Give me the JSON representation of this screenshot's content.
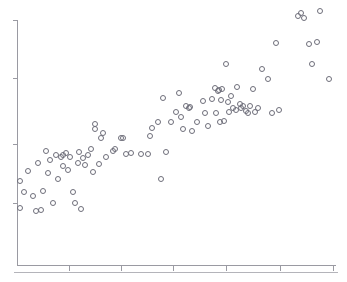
{
  "chart_data": {
    "type": "scatter",
    "title": "",
    "subtitle": "",
    "xlabel": "",
    "ylabel": "",
    "grid": false,
    "legend": null,
    "legend_position": "none",
    "annotations": [],
    "marker": {
      "shape": "circle-open",
      "diameter_px": 5,
      "stroke_color": "#6e6e7a",
      "fill_color": "none",
      "stroke_width": 1
    },
    "axes": {
      "axis_color": "#9a9aa2",
      "spines": [
        "left",
        "bottom"
      ],
      "x_axis_pixel_range": [
        17,
        336
      ],
      "y_axis_pixel_range": [
        20,
        265
      ],
      "x_tick_pixels": [
        69,
        121,
        173,
        226,
        280,
        333
      ],
      "y_tick_pixels": [
        20,
        78,
        144,
        203
      ],
      "x_tick_labels": [
        "",
        "",
        "",
        "",
        "",
        ""
      ],
      "y_tick_labels": [
        "",
        "",
        "",
        ""
      ],
      "xlim": [
        0,
        1
      ],
      "ylim": [
        0,
        1
      ],
      "tick_direction": "out"
    },
    "footer_rule": {
      "visible": true,
      "y_pixel": 272,
      "x_start": 14,
      "x_end": 338,
      "color": "#b4b4ba"
    },
    "n_points": 101,
    "points_pixels": [
      [
        20,
        208
      ],
      [
        20,
        181
      ],
      [
        24,
        192
      ],
      [
        28,
        171
      ],
      [
        33,
        196
      ],
      [
        36,
        211
      ],
      [
        38,
        163
      ],
      [
        41,
        210
      ],
      [
        43,
        191
      ],
      [
        46,
        151
      ],
      [
        48,
        173
      ],
      [
        50,
        160
      ],
      [
        53,
        203
      ],
      [
        56,
        155
      ],
      [
        58,
        179
      ],
      [
        61,
        157
      ],
      [
        63,
        166
      ],
      [
        63,
        155
      ],
      [
        66,
        153
      ],
      [
        68,
        170
      ],
      [
        70,
        157
      ],
      [
        73,
        192
      ],
      [
        75,
        203
      ],
      [
        78,
        163
      ],
      [
        79,
        152
      ],
      [
        81,
        209
      ],
      [
        83,
        158
      ],
      [
        85,
        165
      ],
      [
        88,
        155
      ],
      [
        91,
        149
      ],
      [
        93,
        172
      ],
      [
        95,
        129
      ],
      [
        95,
        124
      ],
      [
        99,
        164
      ],
      [
        101,
        138
      ],
      [
        103,
        133
      ],
      [
        106,
        157
      ],
      [
        113,
        151
      ],
      [
        115,
        149
      ],
      [
        121,
        138
      ],
      [
        123,
        138
      ],
      [
        126,
        154
      ],
      [
        131,
        153
      ],
      [
        141,
        154
      ],
      [
        148,
        154
      ],
      [
        150,
        136
      ],
      [
        152,
        128
      ],
      [
        158,
        122
      ],
      [
        161,
        179
      ],
      [
        163,
        98
      ],
      [
        166,
        152
      ],
      [
        171,
        122
      ],
      [
        176,
        112
      ],
      [
        179,
        93
      ],
      [
        181,
        117
      ],
      [
        183,
        129
      ],
      [
        186,
        106
      ],
      [
        189,
        108
      ],
      [
        190,
        107
      ],
      [
        192,
        131
      ],
      [
        197,
        122
      ],
      [
        203,
        101
      ],
      [
        205,
        113
      ],
      [
        208,
        126
      ],
      [
        212,
        99
      ],
      [
        215,
        88
      ],
      [
        216,
        113
      ],
      [
        218,
        91
      ],
      [
        219,
        90
      ],
      [
        220,
        122
      ],
      [
        221,
        100
      ],
      [
        222,
        89
      ],
      [
        224,
        121
      ],
      [
        226,
        64
      ],
      [
        228,
        102
      ],
      [
        229,
        112
      ],
      [
        231,
        96
      ],
      [
        233,
        108
      ],
      [
        236,
        110
      ],
      [
        237,
        87
      ],
      [
        240,
        104
      ],
      [
        241,
        108
      ],
      [
        243,
        106
      ],
      [
        246,
        111
      ],
      [
        248,
        113
      ],
      [
        250,
        106
      ],
      [
        253,
        89
      ],
      [
        255,
        112
      ],
      [
        258,
        108
      ],
      [
        262,
        69
      ],
      [
        268,
        79
      ],
      [
        272,
        113
      ],
      [
        276,
        43
      ],
      [
        279,
        110
      ],
      [
        298,
        16
      ],
      [
        301,
        13
      ],
      [
        304,
        18
      ],
      [
        309,
        44
      ],
      [
        312,
        64
      ],
      [
        317,
        42
      ],
      [
        320,
        11
      ],
      [
        329,
        79
      ]
    ]
  }
}
